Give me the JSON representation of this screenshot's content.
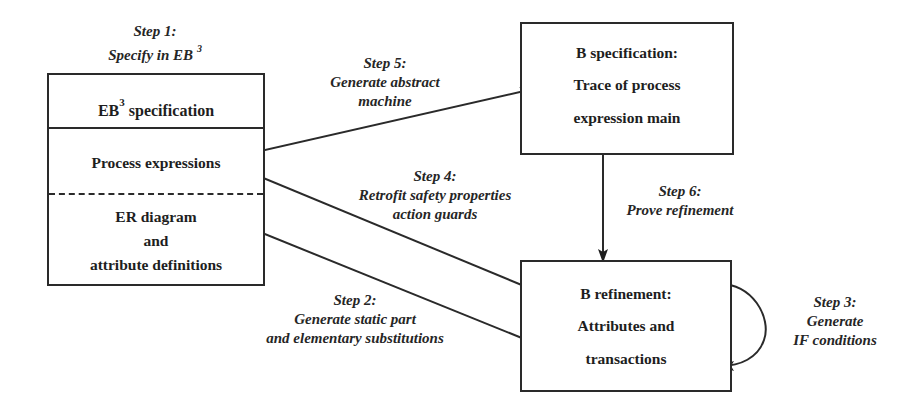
{
  "diagram": {
    "nodes": {
      "eb3_spec": {
        "title": "EB",
        "title_sup": "3",
        "title_rest": " specification",
        "section_process": "Process expressions",
        "section_er_line1": "ER diagram",
        "section_er_line2": "and",
        "section_er_line3": "attribute definitions"
      },
      "b_spec": {
        "title": "B specification:",
        "line1": "Trace of process",
        "line2": "expression main"
      },
      "b_refinement": {
        "title": "B refinement:",
        "line1": "Attributes and",
        "line2": "transactions"
      }
    },
    "steps": {
      "step1": {
        "label": "Step 1:",
        "desc": "Specify in EB",
        "desc_sup": "3"
      },
      "step2": {
        "label": "Step 2:",
        "desc1": "Generate static part",
        "desc2": "and elementary substitutions"
      },
      "step3": {
        "label": "Step 3:",
        "desc1": "Generate",
        "desc2": "IF conditions"
      },
      "step4": {
        "label": "Step 4:",
        "desc1": "Retrofit safety properties",
        "desc2": "action guards"
      },
      "step5": {
        "label": "Step 5:",
        "desc1": "Generate abstract",
        "desc2": "machine"
      },
      "step6": {
        "label": "Step 6:",
        "desc1": "Prove refinement"
      }
    },
    "edges": [
      {
        "from": "eb3_spec.process_expressions",
        "to": "b_spec",
        "step": "step5"
      },
      {
        "from": "b_refinement",
        "to": "eb3_spec.process_expressions",
        "step": "step4"
      },
      {
        "from": "eb3_spec.er_diagram",
        "to": "b_refinement",
        "step": "step2"
      },
      {
        "from": "b_spec",
        "to": "b_refinement",
        "step": "step6"
      },
      {
        "from": "b_refinement",
        "to": "b_refinement",
        "step": "step3"
      }
    ],
    "colors": {
      "stroke": "#2a2a2a",
      "background": "#ffffff",
      "text": "#1e1e1e"
    }
  }
}
